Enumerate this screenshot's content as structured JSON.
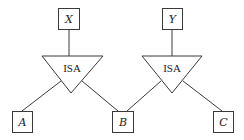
{
  "diagram": {
    "type": "ISA hierarchy",
    "nodes": [
      {
        "id": "X",
        "label": "X",
        "x": 58,
        "y": 8,
        "w": 21,
        "h": 21
      },
      {
        "id": "Y",
        "label": "Y",
        "x": 162,
        "y": 8,
        "w": 20,
        "h": 21
      },
      {
        "id": "A",
        "label": "A",
        "x": 12,
        "y": 111,
        "w": 20,
        "h": 21
      },
      {
        "id": "B",
        "label": "B",
        "x": 112,
        "y": 111,
        "w": 21,
        "h": 21
      },
      {
        "id": "C",
        "label": "C",
        "x": 213,
        "y": 111,
        "w": 20,
        "h": 21
      }
    ],
    "isa": [
      {
        "id": "isa1",
        "label": "ISA",
        "parent": "X",
        "children": [
          "A",
          "B"
        ]
      },
      {
        "id": "isa2",
        "label": "ISA",
        "parent": "Y",
        "children": [
          "B",
          "C"
        ]
      }
    ],
    "colors": {
      "stroke": "#3a3a3a",
      "background": "#ffffff"
    }
  }
}
